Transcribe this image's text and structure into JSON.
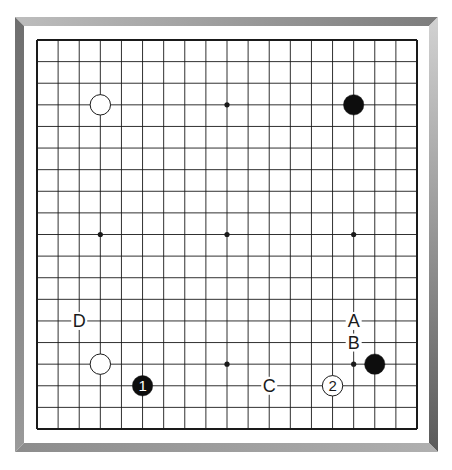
{
  "board": {
    "size": 19,
    "grid": {
      "x0": 37,
      "y0": 40,
      "x1": 417,
      "y1": 429
    },
    "colors": {
      "line": "#1a1a1a",
      "background": "#ffffff",
      "black_stone": "#0d0d0d",
      "white_stone": "#ffffff",
      "frame_top_light": "#c8c8c8",
      "frame_top_dark": "#7a7a7a",
      "frame_left": "#8a8a8a",
      "frame_right": "#c4c4c4",
      "frame_bottom_light": "#9a9a9a",
      "frame_bottom_dark": "#6a6a6a"
    },
    "star_points": [
      [
        3,
        3
      ],
      [
        9,
        3
      ],
      [
        15,
        3
      ],
      [
        3,
        9
      ],
      [
        9,
        9
      ],
      [
        15,
        9
      ],
      [
        3,
        15
      ],
      [
        9,
        15
      ],
      [
        15,
        15
      ]
    ],
    "stones": [
      {
        "color": "white",
        "col": 3,
        "row": 3,
        "label": ""
      },
      {
        "color": "black",
        "col": 15,
        "row": 3,
        "label": ""
      },
      {
        "color": "white",
        "col": 3,
        "row": 15,
        "label": ""
      },
      {
        "color": "black",
        "col": 16,
        "row": 15,
        "label": ""
      },
      {
        "color": "black",
        "col": 5,
        "row": 16,
        "label": "1"
      },
      {
        "color": "white",
        "col": 14,
        "row": 16,
        "label": "2"
      }
    ],
    "markers": [
      {
        "text": "D",
        "col": 2,
        "row": 13
      },
      {
        "text": "A",
        "col": 15,
        "row": 13
      },
      {
        "text": "B",
        "col": 15,
        "row": 14
      },
      {
        "text": "C",
        "col": 11,
        "row": 16
      }
    ]
  }
}
